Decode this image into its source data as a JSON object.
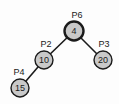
{
  "diagram": {
    "type": "tree",
    "background": "#fdfdfd",
    "node_fill": "#c9c9c9",
    "node_stroke": "#1b1b1b",
    "edge_color": "#1b1b1b",
    "edge_width": 1.6,
    "text_color": "#1b1b1b",
    "label_font_size": 9,
    "value_font_size": 9,
    "nodes": [
      {
        "id": "P6",
        "label": "P6",
        "value": "4",
        "x": 74,
        "y": 31,
        "r": 9.5,
        "stroke_width": 2.4,
        "label_x": 77,
        "label_y": 17.5
      },
      {
        "id": "P2",
        "label": "P2",
        "value": "10",
        "x": 44,
        "y": 60,
        "r": 9,
        "stroke_width": 1.4,
        "label_x": 46,
        "label_y": 46.5
      },
      {
        "id": "P3",
        "label": "P3",
        "value": "20",
        "x": 103,
        "y": 60,
        "r": 9,
        "stroke_width": 1.4,
        "label_x": 104,
        "label_y": 46.5
      },
      {
        "id": "P4",
        "label": "P4",
        "value": "15",
        "x": 20,
        "y": 88,
        "r": 9,
        "stroke_width": 1.4,
        "label_x": 19,
        "label_y": 74.5
      }
    ],
    "edges": [
      {
        "from": "P6",
        "to": "P2"
      },
      {
        "from": "P6",
        "to": "P3"
      },
      {
        "from": "P2",
        "to": "P4"
      }
    ]
  }
}
